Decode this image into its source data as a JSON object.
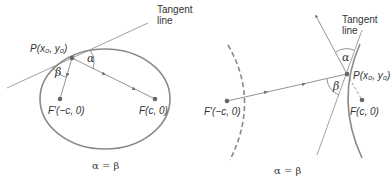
{
  "figures": [
    {
      "id": "ellipse",
      "tangent_label_line1": "Tangent",
      "tangent_label_line2": "line",
      "point_label": "P(x₀, y₀)",
      "left_focus_label": "F′(−c, 0)",
      "right_focus_label": "F(c, 0)",
      "alpha": "α",
      "beta": "β",
      "equation": "α = β"
    },
    {
      "id": "hyperbola",
      "tangent_label_line1": "Tangent",
      "tangent_label_line2": "line",
      "point_label": "P(x₀, y₀)",
      "left_focus_label": "F′(−c, 0)",
      "right_focus_label": "F(c, 0)",
      "alpha": "α",
      "beta": "β",
      "equation": "α = β"
    }
  ],
  "colors": {
    "curve": "#8a8a8a",
    "line": "#777777",
    "point": "#666666",
    "text": "#333333"
  }
}
